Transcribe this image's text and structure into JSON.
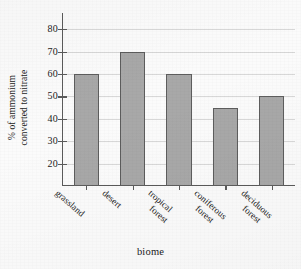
{
  "chart_data": {
    "type": "bar",
    "title": "",
    "subtitle": "",
    "xlabel": "biome",
    "ylabel": "% of ammonium converted to nitrate",
    "ylabel_lines": [
      "% of ammonium",
      "converted to nitrate"
    ],
    "categories": [
      "grassland",
      "desert",
      "tropical forest",
      "coniferous forest",
      "deciduous forest"
    ],
    "category_lines": [
      [
        "grassland"
      ],
      [
        "desert"
      ],
      [
        "tropical",
        "forest"
      ],
      [
        "coniferous",
        "forest"
      ],
      [
        "deciduous",
        "forest"
      ]
    ],
    "values": [
      60,
      70,
      60,
      45,
      50
    ],
    "ylim": [
      10,
      85
    ],
    "yticks": [
      20,
      30,
      40,
      50,
      60,
      70,
      80
    ],
    "ytick_labels": [
      "20",
      "30",
      "40",
      "50",
      "60",
      "70",
      "80"
    ],
    "grid": true,
    "grid_axis": "y",
    "legend": false,
    "legend_position": "none",
    "bar_fill_color": "#a8a8a8",
    "bar_edge_color": "#5d5d5d",
    "axis_color": "#5a5a5a",
    "gridline_color": "#d8d8d8",
    "background_color": "#fbfbfb"
  }
}
